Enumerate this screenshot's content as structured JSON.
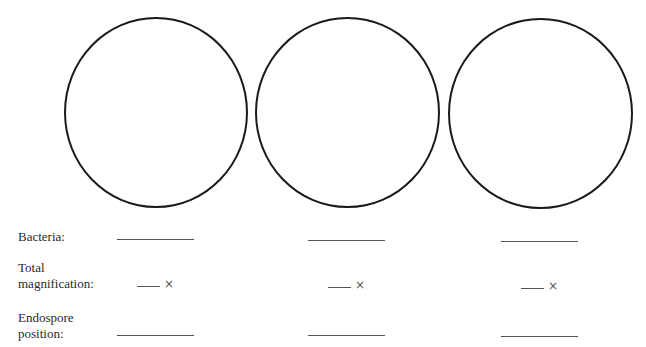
{
  "worksheet": {
    "fields": [
      {
        "id": "bacteria",
        "label": "Bacteria:"
      },
      {
        "id": "total_magnification",
        "label_line1": "Total",
        "label_line2": "magnification:",
        "suffix": "×"
      },
      {
        "id": "endospore_position",
        "label_line1": "Endospore",
        "label_line2": "position:"
      }
    ],
    "columns": [
      {
        "circle": "field-of-view-1",
        "bacteria": "",
        "magnification": "",
        "endospore_position": ""
      },
      {
        "circle": "field-of-view-2",
        "bacteria": "",
        "magnification": "",
        "endospore_position": ""
      },
      {
        "circle": "field-of-view-3",
        "bacteria": "",
        "magnification": "",
        "endospore_position": ""
      }
    ]
  }
}
